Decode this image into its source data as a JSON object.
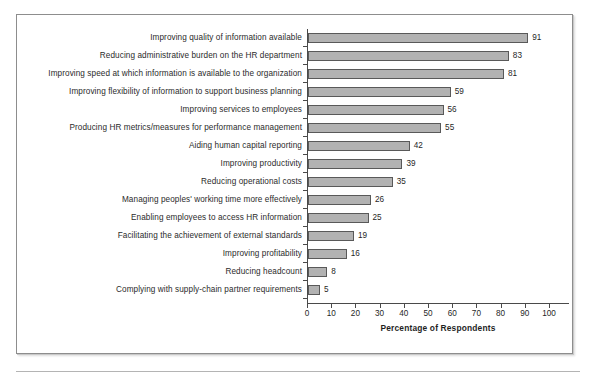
{
  "figure": {
    "frame_border_color": "#8d8d8d",
    "bar_fill_color": "#b2b2b2",
    "bar_border_color": "#595959",
    "axis_color": "#4a4a4a"
  },
  "chart_data": {
    "type": "bar",
    "orientation": "horizontal",
    "title": "",
    "xlabel": "Percentage of Respondents",
    "ylabel": "",
    "xlim": [
      0,
      100
    ],
    "xticks": [
      0,
      10,
      20,
      30,
      40,
      50,
      60,
      70,
      80,
      90,
      100
    ],
    "xtick_labels": [
      "0",
      "10",
      "20",
      "30",
      "40",
      "50",
      "60",
      "70",
      "80",
      "90",
      "100"
    ],
    "grid": false,
    "legend": null,
    "data_labels": true,
    "categories": [
      "Improving quality of information available",
      "Reducing administrative burden on the HR department",
      "Improving speed at which information is available to the organization",
      "Improving flexibility of information to support business planning",
      "Improving services to employees",
      "Producing HR metrics/measures for performance management",
      "Aiding human capital reporting",
      "Improving productivity",
      "Reducing operational costs",
      "Managing peoples' working time more effectively",
      "Enabling employees to access HR information",
      "Facilitating the achievement of external standards",
      "Improving profitability",
      "Reducing headcount",
      "Complying with supply-chain partner requirements"
    ],
    "values": [
      91,
      83,
      81,
      59,
      56,
      55,
      42,
      39,
      35,
      26,
      25,
      19,
      16,
      8,
      5
    ],
    "value_labels": [
      "91",
      "83",
      "81",
      "59",
      "56",
      "55",
      "42",
      "39",
      "35",
      "26",
      "25",
      "19",
      "16",
      "8",
      "5"
    ]
  }
}
